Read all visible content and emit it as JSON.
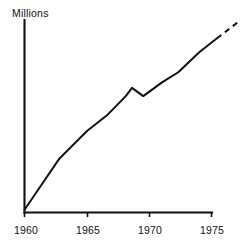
{
  "chart_data": {
    "type": "line",
    "title": "",
    "subtitle": "",
    "xlabel": "",
    "ylabel": "Millions",
    "xlim": [
      1960,
      1977.2
    ],
    "ylim": [
      0,
      10.5
    ],
    "grid": false,
    "legend": null,
    "xticks": [
      1960,
      1965,
      1970,
      1975
    ],
    "xtick_labels": [
      "1960",
      "1965",
      "1970",
      "1975"
    ],
    "yticks": [],
    "ytick_labels": [],
    "annotations": [],
    "series": [
      {
        "name": "Observed",
        "style": "solid",
        "color": "#111111",
        "x": [
          1960.0,
          1960.9,
          1962.8,
          1965.0,
          1966.6,
          1968.1,
          1968.6,
          1969.5,
          1971.0,
          1972.3,
          1974.0,
          1975.4
        ],
        "y": [
          0.15,
          1.05,
          2.95,
          4.45,
          5.3,
          6.35,
          6.8,
          6.35,
          7.1,
          7.65,
          8.75,
          9.5
        ]
      },
      {
        "name": "Projected",
        "style": "dashed",
        "color": "#111111",
        "x": [
          1975.4,
          1977.2
        ],
        "y": [
          9.5,
          10.45
        ]
      }
    ]
  },
  "axes": {
    "y_axis_label": "Millions"
  }
}
